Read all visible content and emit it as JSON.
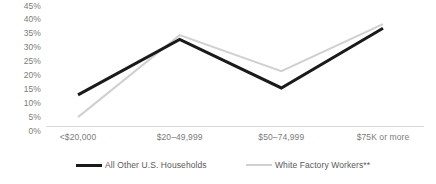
{
  "chart_data": {
    "type": "line",
    "title": "",
    "subtitle": "",
    "xlabel": "",
    "ylabel": "",
    "categories": [
      "<$20,000",
      "$20–49,999",
      "$50–74,999",
      "$75K or more"
    ],
    "series": [
      {
        "name": "All Other U.S. Households",
        "values": [
          13,
          33,
          15.5,
          37
        ],
        "color": "#1a1a1a",
        "line_width": 3,
        "legend_swatch": "thick"
      },
      {
        "name": "White Factory Workers**",
        "values": [
          5,
          34.5,
          21.5,
          38.5
        ],
        "color": "#d0d0d0",
        "line_width": 2,
        "legend_swatch": "thin"
      }
    ],
    "ylim": [
      0,
      45
    ],
    "ytick_step": 5,
    "ytick_labels": [
      "45%",
      "40%",
      "35%",
      "30%",
      "25%",
      "20%",
      "15%",
      "10%",
      "5%",
      "0%"
    ],
    "ytick_values": [
      45,
      40,
      35,
      30,
      25,
      20,
      15,
      10,
      5,
      0
    ],
    "grid": false,
    "baseline_color": "#d9d9d9",
    "legend_position": "bottom",
    "axis_text_color": "#7b7b7b",
    "legend_text_color": "#595959",
    "background": "#ffffff"
  }
}
